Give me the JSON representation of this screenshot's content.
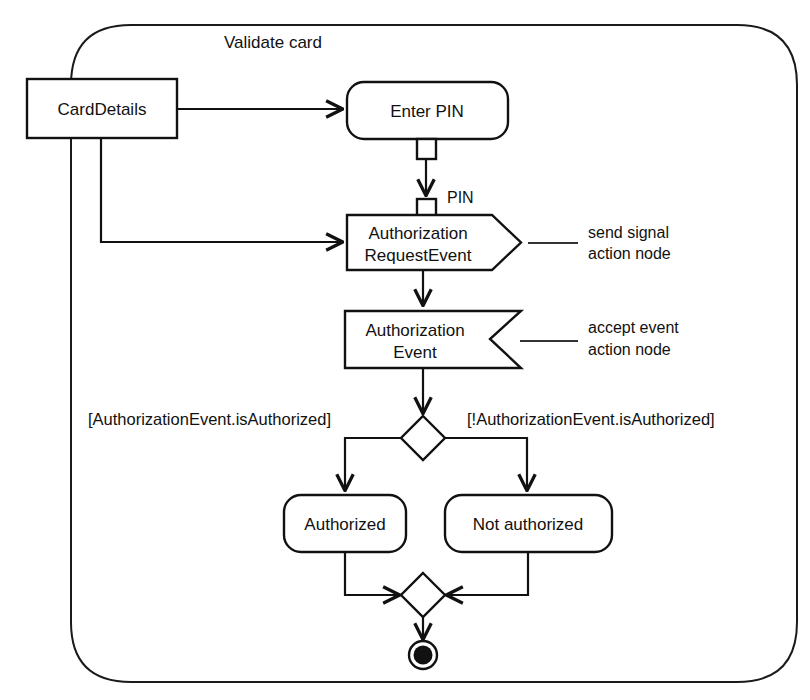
{
  "diagram": {
    "type": "uml-activity-diagram",
    "frame_label": "Validate card",
    "nodes": {
      "card_details": "CardDetails",
      "enter_pin": "Enter PIN",
      "auth_request_event_line1": "Authorization",
      "auth_request_event_line2": "RequestEvent",
      "auth_event_line1": "Authorization",
      "auth_event_line2": "Event",
      "authorized": "Authorized",
      "not_authorized": "Not authorized"
    },
    "pins": {
      "pin_label": "PIN"
    },
    "guards": {
      "left": "[AuthorizationEvent.isAuthorized]",
      "right": "[!AuthorizationEvent.isAuthorized]"
    },
    "annotations": {
      "send_signal_line1": "send signal",
      "send_signal_line2": "action node",
      "accept_event_line1": "accept event",
      "accept_event_line2": "action node"
    },
    "colors": {
      "stroke": "#111111",
      "background": "#ffffff",
      "annotation_leader": "#333333"
    }
  }
}
